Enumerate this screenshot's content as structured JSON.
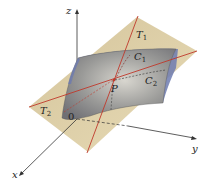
{
  "figure": {
    "type": "3d-surface-tangent-plane",
    "axes": {
      "x_label": "x",
      "y_label": "y",
      "z_label": "z",
      "origin_label": "0"
    },
    "point_label": "P",
    "tangent_lines": [
      {
        "label": "T",
        "subscript": "1"
      },
      {
        "label": "T",
        "subscript": "2"
      }
    ],
    "curves": [
      {
        "label": "C",
        "subscript": "1"
      },
      {
        "label": "C",
        "subscript": "2"
      }
    ],
    "colors": {
      "tangent_plane": "#d9c89a",
      "surface": "#8a8d94",
      "surface_edge": "#6d7bb0",
      "tangent_line": "#c0392b",
      "axis": "#333333"
    }
  }
}
